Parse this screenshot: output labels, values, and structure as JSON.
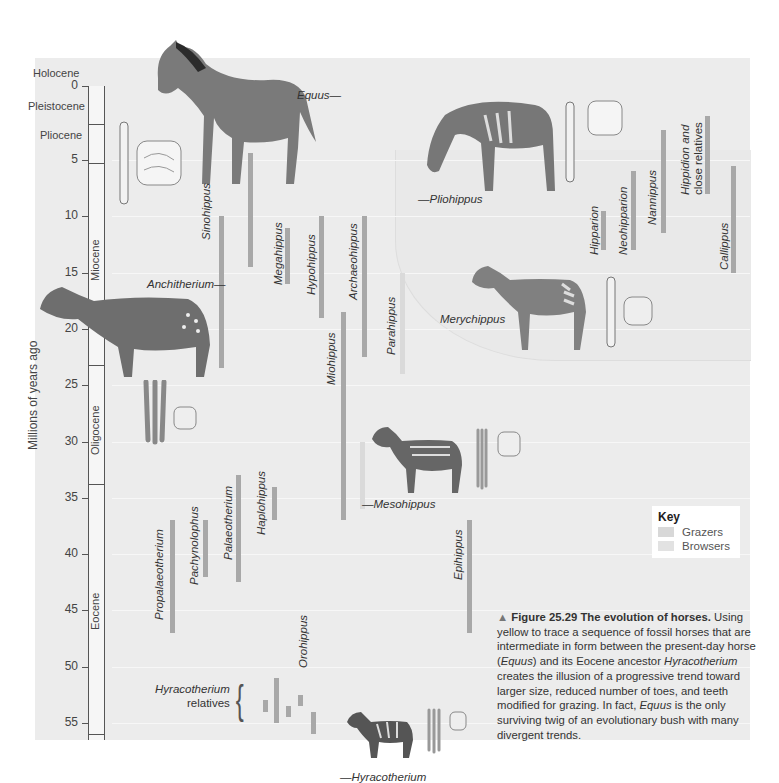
{
  "figure": {
    "y_axis_label": "Millions of years ago",
    "ticks": [
      "0",
      "5",
      "10",
      "15",
      "20",
      "25",
      "30",
      "35",
      "40",
      "45",
      "50",
      "55"
    ],
    "epochs": [
      {
        "name": "Holocene",
        "start": 0,
        "end": 0.01
      },
      {
        "name": "Pleistocene",
        "start": 0.01,
        "end": 2.6
      },
      {
        "name": "Pliocene",
        "start": 2.6,
        "end": 5.3
      },
      {
        "name": "Miocene",
        "start": 5.3,
        "end": 23
      },
      {
        "name": "Oligocene",
        "start": 23,
        "end": 34
      },
      {
        "name": "Eocene",
        "start": 34,
        "end": 56
      }
    ],
    "legend": {
      "title": "Key",
      "items": [
        {
          "label": "Grazers",
          "color": "#d8d8d8"
        },
        {
          "label": "Browsers",
          "color": "#e2e2e2"
        }
      ]
    },
    "genera": [
      {
        "name": "Equus",
        "label_style": "horizontal",
        "start": 0,
        "end": 5
      },
      {
        "name": "Pliohippus",
        "label_style": "horizontal",
        "start": 6,
        "end": 12
      },
      {
        "name": "Merychippus",
        "label_style": "horizontal",
        "start": 11,
        "end": 17
      },
      {
        "name": "Anchitherium",
        "label_style": "horizontal",
        "start": 10,
        "end": 23.5
      },
      {
        "name": "Sinohippus",
        "start": 4.5,
        "end": 14.5
      },
      {
        "name": "Megahippus",
        "start": 11,
        "end": 16
      },
      {
        "name": "Hypohippus",
        "start": 10,
        "end": 19
      },
      {
        "name": "Archaeohippus",
        "start": 10,
        "end": 22.5
      },
      {
        "name": "Parahippus",
        "start": 15,
        "end": 24
      },
      {
        "name": "Miohippus",
        "start": 18.5,
        "end": 37
      },
      {
        "name": "Mesohippus",
        "label_style": "horizontal",
        "start": 30,
        "end": 36
      },
      {
        "name": "Propalaeotherium",
        "start": 37,
        "end": 47
      },
      {
        "name": "Pachynolophus",
        "start": 37,
        "end": 42
      },
      {
        "name": "Palaeotherium",
        "start": 33,
        "end": 42.5
      },
      {
        "name": "Haplohippus",
        "start": 34,
        "end": 37
      },
      {
        "name": "Epihippus",
        "start": 37,
        "end": 47
      },
      {
        "name": "Orohippus",
        "start": 47,
        "end": 52
      },
      {
        "name": "Hyracotherium",
        "label_style": "horizontal",
        "start": 50,
        "end": 56
      },
      {
        "name": "Hipparion",
        "start": 9.5,
        "end": 13
      },
      {
        "name": "Neohipparion",
        "start": 6,
        "end": 13
      },
      {
        "name": "Nannippus",
        "start": 3,
        "end": 11.5
      },
      {
        "name": "Hippidion and close relatives",
        "start": 2,
        "end": 8
      },
      {
        "name": "Callippus",
        "start": 5.5,
        "end": 15
      }
    ],
    "hyracotherium_relatives_label": [
      "Hyracotherium",
      "relatives"
    ]
  },
  "caption": {
    "figure_number": "Figure 25.29",
    "title": "The evolution of horses.",
    "body_parts": [
      "Using yellow to trace a sequence of fossil horses that are intermediate in form between the present-day horse (",
      "Equus",
      ") and its Eocene ancestor ",
      "Hyracotherium",
      " creates the illusion of a progressive trend toward larger size, reduced number of toes, and teeth modified for grazing. In fact, ",
      "Equus",
      " is the only surviving twig of an evolutionary bush with many divergent trends."
    ]
  }
}
